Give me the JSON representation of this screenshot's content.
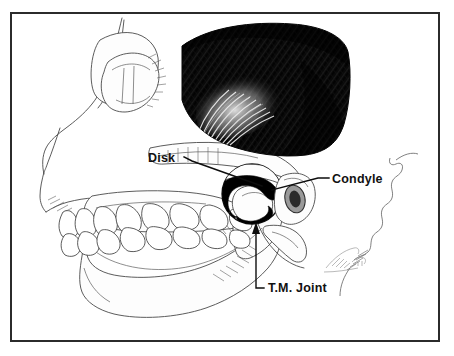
{
  "figure": {
    "background_color": "#ffffff",
    "frame": {
      "name": "illustration-border",
      "color": "#2b2b2b",
      "x": 10,
      "y": 12,
      "width": 430,
      "height": 330
    },
    "labels": [
      {
        "id": "disk",
        "text": "Disk",
        "x": 148,
        "y": 162,
        "anchor": "start",
        "leader_path": "M 184 157 L 192 161 L 262 186"
      },
      {
        "id": "condyle",
        "text": "Condyle",
        "x": 332,
        "y": 183,
        "anchor": "start",
        "leader_path": "M 329 178 L 318 178 L 272 190"
      },
      {
        "id": "tm-joint",
        "text": "T.M. Joint",
        "x": 268,
        "y": 292,
        "anchor": "start",
        "leader_path": "M 264 288 L 256 288 L 256 228"
      }
    ],
    "structures": [
      {
        "name": "cranium-outline",
        "color": "#4a4a4a"
      },
      {
        "name": "temporalis-muscle",
        "color": "#000000"
      },
      {
        "name": "zygomatic-arch",
        "color": "#4a4a4a"
      },
      {
        "name": "maxilla",
        "color": "#4a4a4a"
      },
      {
        "name": "mandible",
        "color": "#4a4a4a"
      },
      {
        "name": "upper-teeth",
        "color": "#3f3f3f"
      },
      {
        "name": "lower-teeth",
        "color": "#3f3f3f"
      },
      {
        "name": "articular-disk",
        "color": "#000000"
      },
      {
        "name": "mandibular-condyle",
        "color": "#4a4a4a"
      },
      {
        "name": "external-auditory-meatus",
        "color": "#4a4a4a"
      },
      {
        "name": "occipital-suture",
        "color": "#6a6a6a"
      },
      {
        "name": "artist-signature",
        "color": "#8c8c8c"
      }
    ]
  }
}
